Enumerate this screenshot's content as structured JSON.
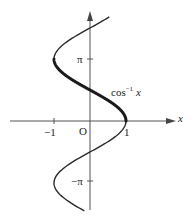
{
  "diagram": {
    "curve_label": {
      "base": "cos",
      "exponent": "−1",
      "var": "x"
    },
    "axes": {
      "x_label": "x",
      "origin_label": "O",
      "x_ticks": [
        "−1",
        "1"
      ],
      "y_ticks": [
        "π",
        "−π"
      ]
    },
    "colors": {
      "curve": "#2a2a2a",
      "axis": "#555555",
      "background": "#ffffff"
    },
    "highlight": "Thick segment from y = 0 to y = π is the principal value branch of cos⁻¹ x"
  }
}
